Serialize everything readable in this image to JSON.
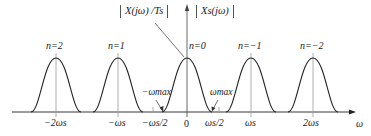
{
  "diagram": {
    "title_left": "X(jω) /Ts",
    "title_right": "Xs(jω)",
    "axis_label": "ω",
    "peaks": [
      {
        "n_label": "n=2",
        "x": 56
      },
      {
        "n_label": "n=1",
        "x": 118
      },
      {
        "n_label": "n=0",
        "x": 187
      },
      {
        "n_label": "n=−1",
        "x": 251
      },
      {
        "n_label": "n=−2",
        "x": 313
      }
    ],
    "ticks": [
      {
        "label": "−2ωs",
        "x": 56
      },
      {
        "label": "−ωs",
        "x": 118
      },
      {
        "label": "−ωs/2",
        "x": 153
      },
      {
        "label": "0",
        "x": 187
      },
      {
        "label": "ωs/2",
        "x": 219
      },
      {
        "label": "ωs",
        "x": 251
      },
      {
        "label": "2ωs",
        "x": 313
      }
    ],
    "annotations": {
      "neg_wmax": "−ωmax",
      "pos_wmax": "ωmax"
    },
    "colors": {
      "line": "#222222",
      "tick": "#888888"
    }
  }
}
